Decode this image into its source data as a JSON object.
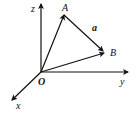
{
  "diagram": {
    "title": "",
    "type": "3d-coordinate-vector-diagram",
    "origin_label": "O",
    "axes": [
      {
        "name": "z",
        "label": "z"
      },
      {
        "name": "y",
        "label": "y"
      },
      {
        "name": "x",
        "label": "x"
      }
    ],
    "points": [
      {
        "name": "A",
        "label": "A"
      },
      {
        "name": "B",
        "label": "B"
      }
    ],
    "vectors": [
      {
        "from": "O",
        "to": "A",
        "label": ""
      },
      {
        "from": "O",
        "to": "B",
        "label": ""
      },
      {
        "from": "A",
        "to": "B",
        "label": "a"
      }
    ]
  }
}
